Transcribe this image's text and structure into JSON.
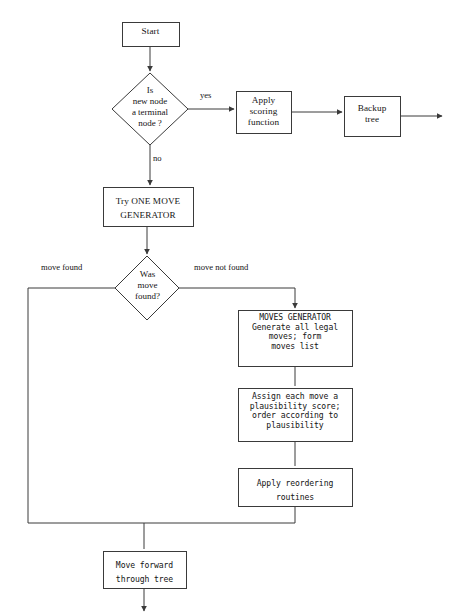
{
  "diagram": {
    "type": "flowchart",
    "background_color": "#ffffff",
    "line_color": "#3a3a3a",
    "text_color": "#141414"
  },
  "nodes": {
    "start": {
      "shape": "rect",
      "label": "Start",
      "x": 122,
      "y": 22,
      "w": 57,
      "h": 24
    },
    "terminal_check": {
      "shape": "diamond",
      "label": "Is\nnew node\na terminal\nnode ?",
      "cx": 150,
      "cy": 109,
      "rx": 38,
      "ry": 36
    },
    "apply_scoring": {
      "shape": "rect",
      "label": "Apply\nscoring\nfunction",
      "x": 236,
      "y": 91,
      "w": 55,
      "h": 42
    },
    "backup_tree": {
      "shape": "rect",
      "label": "Backup\ntree",
      "x": 344,
      "y": 96,
      "w": 56,
      "h": 40
    },
    "try_one_move": {
      "shape": "rect",
      "label": "Try ONE MOVE\nGENERATOR",
      "x": 103,
      "y": 187,
      "w": 90,
      "h": 39
    },
    "was_move_found": {
      "shape": "diamond",
      "label": "Was\nmove\nfound?",
      "cx": 147,
      "cy": 288,
      "rx": 32,
      "ry": 32
    },
    "moves_generator": {
      "shape": "rect",
      "label": "MOVES GENERATOR\nGenerate all legal\nmoves; form\nmoves list",
      "x": 238,
      "y": 310,
      "w": 114,
      "h": 56
    },
    "assign_plausibility": {
      "shape": "rect",
      "label": "Assign each move a\nplausibility score;\norder according to\nplausibility",
      "x": 238,
      "y": 388,
      "w": 114,
      "h": 53
    },
    "apply_reordering": {
      "shape": "rect",
      "label": "Apply reordering\nroutines",
      "x": 238,
      "y": 468,
      "w": 114,
      "h": 38
    },
    "move_forward": {
      "shape": "rect",
      "label": "Move forward\nthrough tree",
      "x": 103,
      "y": 551,
      "w": 83,
      "h": 37
    }
  },
  "edge_labels": {
    "yes": {
      "text": "yes",
      "x": 200,
      "y": 97
    },
    "no": {
      "text": "no",
      "x": 153,
      "y": 160
    },
    "move_found": {
      "text": "move found",
      "x": 41,
      "y": 268
    },
    "move_not_found": {
      "text": "move not found",
      "x": 194,
      "y": 268
    }
  }
}
